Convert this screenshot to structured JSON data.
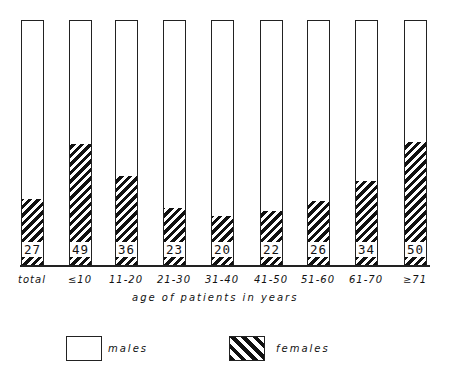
{
  "chart_data": {
    "type": "bar",
    "stacked": true,
    "title": "",
    "xlabel": "age of patients in years",
    "ylabel": "",
    "ylim": [
      0,
      100
    ],
    "grid": false,
    "legend_position": "bottom",
    "categories": [
      "total",
      "≤10",
      "11-20",
      "21-30",
      "31-40",
      "41-50",
      "51-60",
      "61-70",
      "≥71"
    ],
    "series": [
      {
        "name": "females",
        "pattern": "hatched",
        "values": [
          27,
          49,
          36,
          23,
          20,
          22,
          26,
          34,
          50
        ]
      },
      {
        "name": "males",
        "pattern": "white",
        "values": [
          73,
          51,
          64,
          77,
          80,
          78,
          74,
          66,
          50
        ]
      }
    ],
    "data_labels": [
      "27",
      "49",
      "36",
      "23",
      "20",
      "22",
      "26",
      "34",
      "50"
    ]
  },
  "legend": {
    "males": "males",
    "females": "females"
  },
  "colors": {
    "ink": "#111111",
    "background": "#ffffff"
  }
}
